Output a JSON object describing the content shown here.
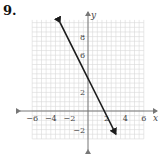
{
  "problem": {
    "number": "9."
  },
  "chart_data": {
    "type": "line",
    "title": "",
    "xlabel": "x",
    "ylabel": "y",
    "xlim": [
      -6,
      6
    ],
    "ylim": [
      -3,
      9.5
    ],
    "x_ticks": [
      "-6",
      "-4",
      "-2",
      "2",
      "4",
      "6"
    ],
    "y_ticks": [
      "8",
      "6",
      "2",
      "-2"
    ],
    "grid": true,
    "series": [
      {
        "name": "line",
        "equation": "y = -2x + 3.5",
        "x": [
          -3,
          3
        ],
        "y": [
          9.5,
          -2.5
        ],
        "arrows_both_ends": true,
        "color": "#1a1a1a"
      }
    ]
  },
  "colors": {
    "grid": "#d4d4d4",
    "axis": "#777777",
    "line": "#1a1a1a"
  }
}
